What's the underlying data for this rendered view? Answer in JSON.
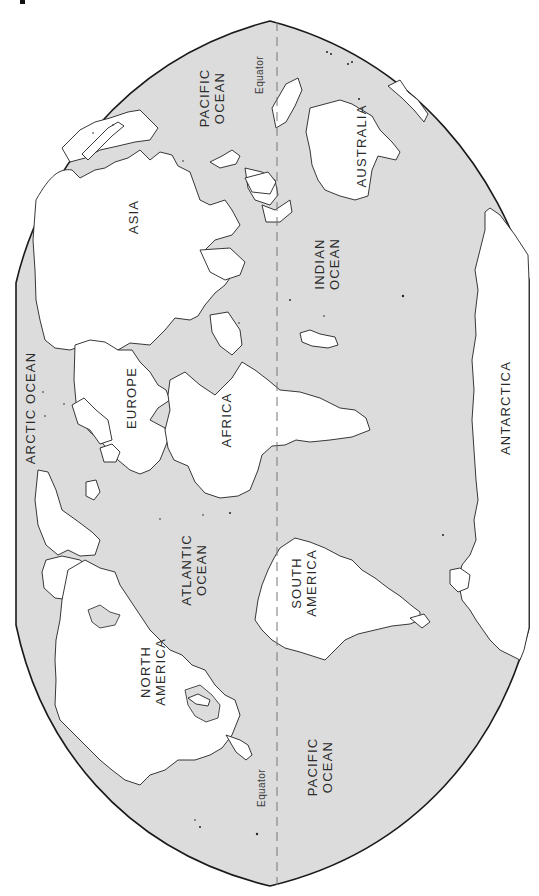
{
  "map": {
    "title": "World map (rotated, north at left)",
    "orientation": "rotated-90-ccw",
    "colors": {
      "ocean": "#dcdcdc",
      "land": "#ffffff",
      "outline": "#1a1a1a",
      "equator": "#777777"
    },
    "equator": {
      "label_top": "Equator",
      "label_bottom": "Equator"
    },
    "continents": {
      "asia": "ASIA",
      "europe": "EUROPE",
      "africa": "AFRICA",
      "australia": "AUSTRALIA",
      "north_america": [
        "NORTH",
        "AMERICA"
      ],
      "south_america": [
        "SOUTH",
        "AMERICA"
      ],
      "antarctica": "ANTARCTICA"
    },
    "oceans": {
      "pacific_top": [
        "PACIFIC",
        "OCEAN"
      ],
      "pacific_bottom": [
        "PACIFIC",
        "OCEAN"
      ],
      "indian": [
        "INDIAN",
        "OCEAN"
      ],
      "atlantic": [
        "ATLANTIC",
        "OCEAN"
      ],
      "arctic": "ARCTIC OCEAN"
    }
  }
}
